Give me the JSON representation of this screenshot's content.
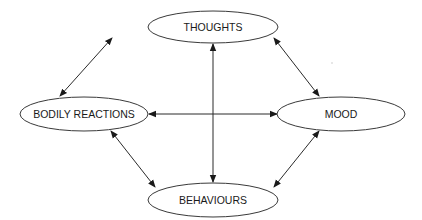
{
  "diagram": {
    "type": "cycle-diagram",
    "nodes": [
      {
        "id": "thoughts",
        "label": "THOUGHTS",
        "cx": 213,
        "cy": 27,
        "rx": 65,
        "ry": 16
      },
      {
        "id": "bodily-reactions",
        "label": "BODILY REACTIONS",
        "cx": 84,
        "cy": 114,
        "rx": 64,
        "ry": 17
      },
      {
        "id": "mood",
        "label": "MOOD",
        "cx": 341,
        "cy": 114,
        "rx": 64,
        "ry": 17
      },
      {
        "id": "behaviours",
        "label": "BEHAVIOURS",
        "cx": 213,
        "cy": 200,
        "rx": 65,
        "ry": 17
      }
    ],
    "edges": [
      {
        "from": "thoughts",
        "to": "bodily-reactions",
        "bidirectional": true
      },
      {
        "from": "thoughts",
        "to": "mood",
        "bidirectional": true
      },
      {
        "from": "thoughts",
        "to": "behaviours",
        "bidirectional": true
      },
      {
        "from": "bodily-reactions",
        "to": "mood",
        "bidirectional": true
      },
      {
        "from": "bodily-reactions",
        "to": "behaviours",
        "bidirectional": true
      },
      {
        "from": "mood",
        "to": "behaviours",
        "bidirectional": true
      }
    ]
  }
}
